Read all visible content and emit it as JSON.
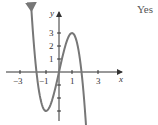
{
  "answer": "Yes",
  "chart_data": {
    "type": "line",
    "title": "",
    "xlabel": "x",
    "ylabel": "y",
    "x_ticks": [
      "-3",
      "-1",
      "1",
      "3"
    ],
    "y_ticks": [
      "1",
      "2",
      "3"
    ],
    "xlim": [
      -4,
      4
    ],
    "ylim": [
      -4,
      4
    ],
    "grid": false,
    "series": [
      {
        "name": "f(x)",
        "description": "cubic with local min (-1,-3), local max (1,3), roots near -1.7, 0, 1.7; arrows on both ends",
        "x": [
          -2.0,
          -1.7,
          -1.5,
          -1.0,
          -0.5,
          0,
          0.5,
          1.0,
          1.5,
          1.7,
          2.2
        ],
        "y": [
          3.0,
          0.0,
          -1.7,
          -3.0,
          -2.1,
          0.0,
          2.1,
          3.0,
          1.7,
          0.0,
          -5.9
        ]
      }
    ],
    "color": "#777777"
  },
  "labels": {
    "x_axis": "x",
    "y_axis": "y",
    "xt_m3": "−3",
    "xt_m1": "−1",
    "xt_1": "1",
    "xt_3": "3",
    "yt_1": "1",
    "yt_2": "2",
    "yt_3": "3"
  }
}
